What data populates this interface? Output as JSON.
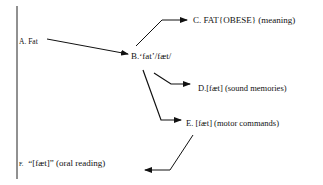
{
  "diagram": {
    "nodes": {
      "a": {
        "id": "A",
        "label": "A. Fat"
      },
      "b": {
        "id": "B",
        "label": "B.‘fat’/fæt/"
      },
      "c": {
        "id": "C",
        "label": "C. FAT{OBESE} (meaning)"
      },
      "d": {
        "id": "D",
        "label": "D.[fæt] (sound memories)"
      },
      "e": {
        "id": "E",
        "label": "E. [fæt] (motor commands)"
      },
      "f": {
        "id": "F",
        "letter": "F.",
        "label": "“[fæt]”  (oral reading)"
      }
    },
    "edges": [
      {
        "from": "A",
        "to": "B"
      },
      {
        "from": "B",
        "to": "C"
      },
      {
        "from": "B",
        "to": "D"
      },
      {
        "from": "B",
        "to": "E"
      },
      {
        "from": "E",
        "to": "F"
      }
    ],
    "colors": {
      "ink": "#111111",
      "background": "#ffffff"
    }
  }
}
